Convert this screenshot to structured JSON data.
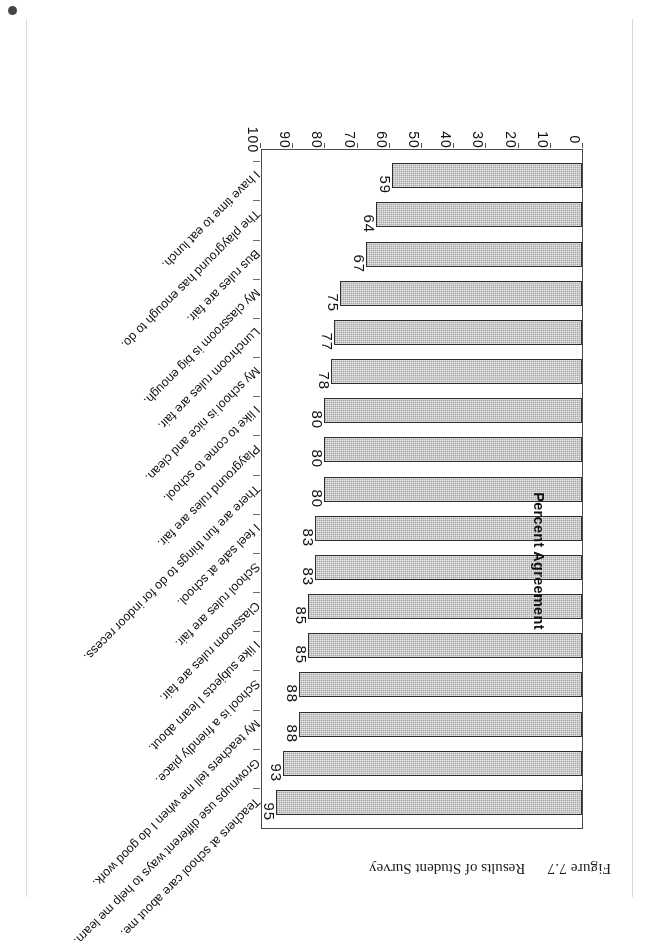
{
  "page": {
    "caption_number": "Figure 7.7",
    "caption_title": "Results of Student Survey"
  },
  "chart_data": {
    "type": "bar",
    "orientation": "horizontal",
    "title": "Results of Student Survey",
    "xlabel": "",
    "ylabel": "Percent Agreement",
    "axis_title": "Percent Agreement",
    "ylim": [
      0,
      100
    ],
    "axis_ticks": [
      "0",
      "10",
      "20",
      "30",
      "40",
      "50",
      "60",
      "70",
      "80",
      "90",
      "100"
    ],
    "grid": false,
    "legend": "none",
    "bar_fill_color": "#a8a8a8",
    "bar_border_color": "#2e2e2e",
    "categories": [
      "Teachers at school care about me.",
      "Grownups use different ways to help me learn.",
      "My teachers tell me when I do good work.",
      "School is a friendly place.",
      "I like subjects I learn about.",
      "Classroom rules are fair.",
      "School rules are fair.",
      "I feel safe at school.",
      "There are fun things to do for indoor recess.",
      "Playground rules are fair.",
      "I like to come to school.",
      "My school is nice and clean.",
      "Lunchroom rules are fair.",
      "My classroom is big enough.",
      "Bus rules are fair.",
      "The playground has enough to do.",
      "I have time to eat lunch."
    ],
    "values": [
      95,
      93,
      88,
      88,
      85,
      85,
      83,
      83,
      80,
      80,
      80,
      78,
      77,
      75,
      67,
      64,
      59
    ],
    "bars": [
      {
        "label": "Teachers at school care about me.",
        "value": 95,
        "value_label": "95"
      },
      {
        "label": "Grownups use different ways to help me learn.",
        "value": 93,
        "value_label": "93"
      },
      {
        "label": "My teachers tell me when I do good work.",
        "value": 88,
        "value_label": "88"
      },
      {
        "label": "School is a friendly place.",
        "value": 88,
        "value_label": "88"
      },
      {
        "label": "I like subjects I learn about.",
        "value": 85,
        "value_label": "85"
      },
      {
        "label": "Classroom rules are fair.",
        "value": 85,
        "value_label": "85"
      },
      {
        "label": "School rules are fair.",
        "value": 83,
        "value_label": "83"
      },
      {
        "label": "I feel safe at school.",
        "value": 83,
        "value_label": "83"
      },
      {
        "label": "There are fun things to do for indoor recess.",
        "value": 80,
        "value_label": "80"
      },
      {
        "label": "Playground rules are fair.",
        "value": 80,
        "value_label": "80"
      },
      {
        "label": "I like to come to school.",
        "value": 80,
        "value_label": "80"
      },
      {
        "label": "My school is nice and clean.",
        "value": 78,
        "value_label": "78"
      },
      {
        "label": "Lunchroom rules are fair.",
        "value": 77,
        "value_label": "77"
      },
      {
        "label": "My classroom is big enough.",
        "value": 75,
        "value_label": "75"
      },
      {
        "label": "Bus rules are fair.",
        "value": 67,
        "value_label": "67"
      },
      {
        "label": "The playground has enough to do.",
        "value": 64,
        "value_label": "64"
      },
      {
        "label": "I have time to eat lunch.",
        "value": 59,
        "value_label": "59"
      }
    ]
  }
}
